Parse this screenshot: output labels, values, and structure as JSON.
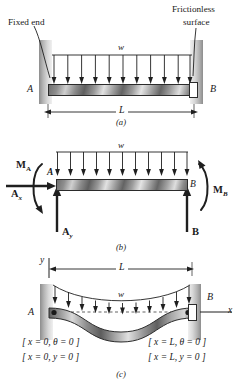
{
  "figure": {
    "title_implied": "Fixed-end beam with uniformly distributed load",
    "panels": [
      {
        "id": "a",
        "caption": "(a)",
        "annotations": {
          "fixed_end": "Fixed end",
          "frictionless_surface_line1": "Frictionless",
          "frictionless_surface_line2": "surface",
          "load_symbol": "w",
          "left_support_label": "A",
          "right_support_label": "B",
          "span_label": "L"
        }
      },
      {
        "id": "b",
        "caption": "(b)",
        "annotations": {
          "load_symbol": "w",
          "moment_a": "M",
          "moment_a_sub": "A",
          "moment_b": "M",
          "moment_b_sub": "B",
          "reaction_ax": "A",
          "reaction_ax_sub": "x",
          "reaction_ay": "A",
          "reaction_ay_sub": "y",
          "reaction_b": "B",
          "node_a": "A",
          "node_b": "B"
        }
      },
      {
        "id": "c",
        "caption": "(c)",
        "annotations": {
          "axis_y": "y",
          "axis_x": "x",
          "span_label": "L",
          "load_symbol": "w",
          "left_support_label": "A",
          "right_support_label": "B",
          "bc_left_1": "[ x = 0, θ = 0 ]",
          "bc_left_2": "[ x = 0, y = 0 ]",
          "bc_right_1": "[ x = L, θ = 0 ]",
          "bc_right_2": "[ x = L, y = 0 ]"
        }
      }
    ],
    "colors": {
      "ink": "#1f1f1f",
      "wall_hatch": "#9a9a9a",
      "beam_dark": "#5f5f5f",
      "beam_light": "#e4e4e4",
      "page_bg": "#ffffff"
    },
    "load_arrow_count": 11
  }
}
